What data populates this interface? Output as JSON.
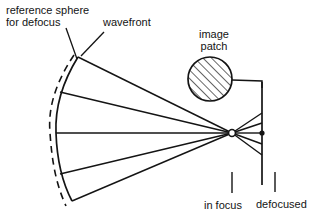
{
  "figure": {
    "domain": "optics-ray-diagram",
    "title_visible": false,
    "background_color": "#ffffff",
    "stroke_color": "#141414",
    "width": 312,
    "height": 224
  },
  "labels": {
    "reference_sphere": "reference sphere\nfor defocus",
    "wavefront": "wavefront",
    "image_patch": "image\npatch",
    "in_focus": "in focus",
    "defocused": "defocused"
  },
  "geometry": {
    "focus_point": {
      "x": 232,
      "y": 133
    },
    "defocus_plane_x": 262,
    "defocus_plane_top_y": 82,
    "defocus_plane_bottom_y": 185,
    "defocus_marker": {
      "x": 262,
      "y": 133
    },
    "wavefront_arc": {
      "top_x": 78,
      "top_y": 57,
      "bottom_x": 72,
      "bottom_y": 200,
      "mid_x": 56,
      "mid_y": 133
    },
    "reference_arc": {
      "top_x": 74,
      "top_y": 55,
      "bottom_x": 66,
      "bottom_y": 205,
      "mid_x": 50,
      "mid_y": 133
    },
    "image_patch_circle": {
      "cx": 210,
      "cy": 79,
      "r": 22
    },
    "ray_count_left": 5,
    "ray_count_right": 5
  },
  "annotations": {
    "reference_leader": {
      "x1": 66,
      "y1": 28,
      "x2": 76,
      "y2": 59
    },
    "wavefront_leader": {
      "x1": 103,
      "y1": 32,
      "x2": 80,
      "y2": 56
    },
    "in_focus_tick": {
      "x": 232,
      "y1": 172,
      "y2": 193
    },
    "defocused_tick": {
      "x": 275,
      "y1": 172,
      "y2": 192
    }
  }
}
